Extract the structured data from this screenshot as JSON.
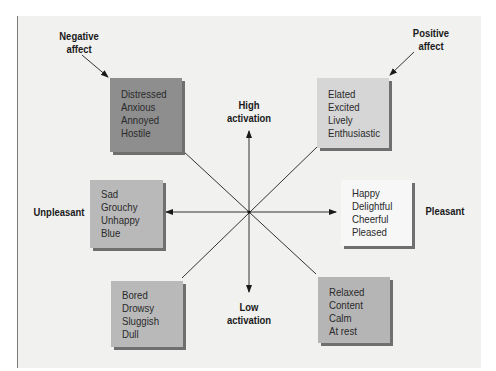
{
  "diagram": {
    "type": "circumplex-of-affect",
    "axes": {
      "vertical_top": "High activation",
      "vertical_bottom": "Low activation",
      "horizontal_left": "Unpleasant",
      "horizontal_right": "Pleasant"
    },
    "callouts": {
      "negative_affect": {
        "line1": "Negative",
        "line2": "affect"
      },
      "positive_affect": {
        "line1": "Positive",
        "line2": "affect"
      },
      "high_activation": {
        "line1": "High",
        "line2": "activation"
      },
      "low_activation": {
        "line1": "Low",
        "line2": "activation"
      },
      "unpleasant": "Unpleasant",
      "pleasant": "Pleasant"
    },
    "boxes": {
      "negative_high": {
        "words": [
          "Distressed",
          "Anxious",
          "Annoyed",
          "Hostile"
        ],
        "color": "#8e8e8e"
      },
      "positive_high": {
        "words": [
          "Elated",
          "Excited",
          "Lively",
          "Enthusiastic"
        ],
        "color": "#d6d6d6"
      },
      "unpleasant": {
        "words": [
          "Sad",
          "Grouchy",
          "Unhappy",
          "Blue"
        ],
        "color": "#b9b9b9"
      },
      "pleasant": {
        "words": [
          "Happy",
          "Delightful",
          "Cheerful",
          "Pleased"
        ],
        "color": "#f7f7f7"
      },
      "low_unpleasant": {
        "words": [
          "Bored",
          "Drowsy",
          "Sluggish",
          "Dull"
        ],
        "color": "#b9b9b9"
      },
      "low_pleasant": {
        "words": [
          "Relaxed",
          "Content",
          "Calm",
          "At rest"
        ],
        "color": "#b5b5b5"
      }
    }
  }
}
